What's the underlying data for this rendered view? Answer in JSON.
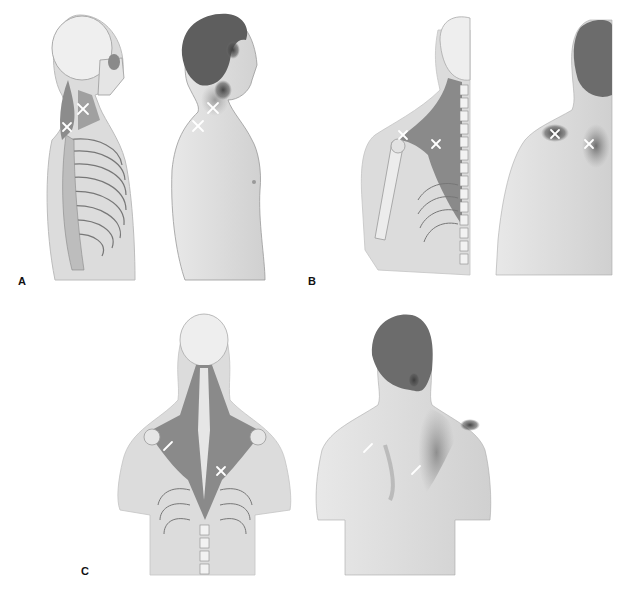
{
  "figure": {
    "panels": [
      {
        "id": "A",
        "label": "A",
        "views": [
          "skeletal-lateral",
          "surface-lateral"
        ]
      },
      {
        "id": "B",
        "label": "B",
        "views": [
          "skeletal-posterior-oblique",
          "surface-posterior-oblique"
        ]
      },
      {
        "id": "C",
        "label": "C",
        "views": [
          "skeletal-posterior",
          "surface-posterior"
        ]
      }
    ],
    "colors": {
      "muscle": "#8a8a8a",
      "skin": "#d4d4d4",
      "bone": "#eeeeee",
      "hair": "#6e6e6e",
      "referred_pain": "#4a4a4a",
      "marker": "#ffffff"
    },
    "marker_symbol": "×"
  }
}
